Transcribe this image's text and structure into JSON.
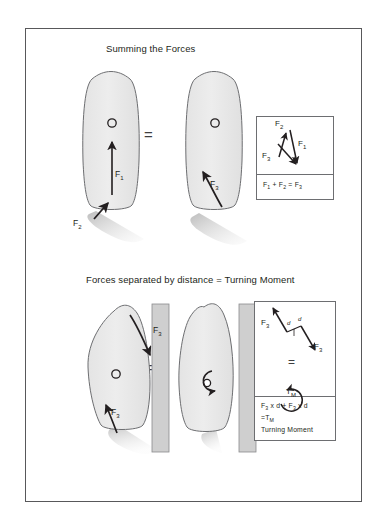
{
  "figure": {
    "title_top": "Summing the Forces",
    "title_bottom": "Forces separated by distance = Turning Moment",
    "equals_symbol": "=",
    "colors": {
      "border": "#58585a",
      "hull_fill": "#e8e8e8",
      "hull_stroke": "#6d6e71",
      "wake": "#d9d9d9",
      "wall_fill": "#cfcfcf",
      "arrow": "#231f20",
      "text": "#231f20"
    }
  },
  "panel_top": {
    "name": "Summing the Forces",
    "boat_left": {
      "label": "boat-with-two-forces",
      "cog_marker": "o",
      "forces": [
        {
          "label": "F",
          "sub": "1",
          "direction": "up",
          "description": "forward thrust vector through centre"
        },
        {
          "label": "F",
          "sub": "2",
          "direction": "up-right-diagonal",
          "description": "side force at stern"
        }
      ]
    },
    "boat_right": {
      "label": "boat-with-resultant-force",
      "cog_marker": "o",
      "forces": [
        {
          "label": "F",
          "sub": "3",
          "direction": "up-left-diagonal",
          "description": "resultant force"
        }
      ]
    },
    "inset": {
      "vector_labels": [
        {
          "label": "F",
          "sub": "2"
        },
        {
          "label": "F",
          "sub": "1"
        },
        {
          "label": "F",
          "sub": "3"
        }
      ],
      "equation_parts": [
        {
          "label": "F",
          "sub": "1"
        },
        {
          "op": " + "
        },
        {
          "label": "F",
          "sub": "2"
        },
        {
          "op": " = "
        },
        {
          "label": "F",
          "sub": "3"
        }
      ],
      "equation_text": "F1 + F2 = F3"
    }
  },
  "panel_bottom": {
    "name": "Forces separated by distance = Turning Moment",
    "boat_left": {
      "label": "boat-against-dock",
      "cog_marker": "o",
      "forces": [
        {
          "label": "F",
          "sub": "3",
          "direction": "down-right-diagonal",
          "description": "force pushing bow into dock"
        },
        {
          "label": "F",
          "sub": "3",
          "direction": "up-left-diagonal",
          "description": "force at stern"
        }
      ],
      "wall": "dock-wall"
    },
    "boat_right": {
      "label": "boat-turning",
      "cog_marker": "o",
      "rotation": "clockwise-turning-moment",
      "wall": "dock-wall"
    },
    "inset": {
      "vector_labels": [
        {
          "label": "F",
          "sub": "3"
        },
        {
          "label": "F",
          "sub": "3"
        }
      ],
      "distance_labels": [
        "d",
        "d"
      ],
      "equals_symbol": "=",
      "moment_symbol": {
        "label": "T",
        "sub": "M"
      },
      "equation_line1_parts": [
        {
          "label": "F",
          "sub": "3"
        },
        {
          "op": " x d + "
        },
        {
          "label": "F",
          "sub": "3"
        },
        {
          "op": " x d"
        }
      ],
      "equation_line1_text": "F3 x d + F3 x d",
      "equation_line2_parts": [
        {
          "op": "="
        },
        {
          "label": "T",
          "sub": "M"
        }
      ],
      "equation_line2_text": "=TM",
      "equation_line3_text": "Turning Moment"
    }
  }
}
